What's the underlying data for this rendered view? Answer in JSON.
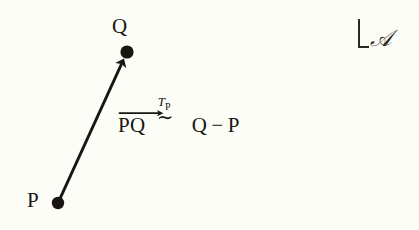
{
  "figure": {
    "background_color": "#fdfdf8",
    "ink_color": "#191611",
    "points": [
      {
        "id": "P",
        "label": "P",
        "x": 58,
        "y": 203
      },
      {
        "id": "Q",
        "label": "Q",
        "x": 127,
        "y": 52
      }
    ],
    "arrow": {
      "name": "vector-PQ",
      "from": "P",
      "to": "Q",
      "x1": 58,
      "y1": 203,
      "x2": 127,
      "y2": 52,
      "stroke_width": 3,
      "color": "#191611",
      "arrowhead": "filled-triangle"
    },
    "equation": {
      "vector_label": "PQ",
      "vector_accent": "right-arrow-overline",
      "relation_symbol": "∼",
      "relation_superscript_base": "T",
      "relation_superscript_subscript": "P",
      "rhs_left": "Q",
      "rhs_operator": "−",
      "rhs_right": "P"
    },
    "frame_marker": {
      "bracket": "corner-bracket-lower-left",
      "symbol": "𝒜"
    }
  }
}
